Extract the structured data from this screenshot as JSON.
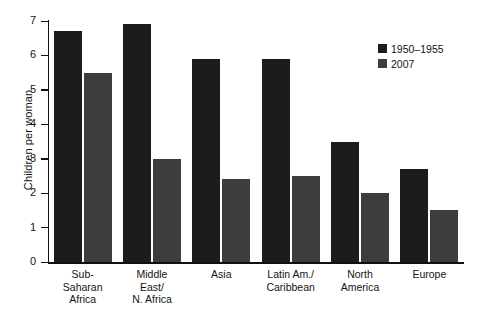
{
  "chart_data": {
    "type": "bar",
    "title": "",
    "subtitle": "",
    "xlabel": "",
    "ylabel": "Children per woman",
    "ylim": [
      0,
      7
    ],
    "ytick_labels": [
      "0",
      "1",
      "2",
      "3",
      "4",
      "5",
      "6",
      "7"
    ],
    "grid": false,
    "legend_position": "top-right",
    "categories": [
      "Sub-Saharan Africa",
      "Middle East/ N. Africa",
      "Asia",
      "Latin Am./ Caribbean",
      "North America",
      "Europe"
    ],
    "category_lines": [
      [
        "Sub-",
        "Saharan",
        "Africa"
      ],
      [
        "Middle",
        "East/",
        "N. Africa"
      ],
      [
        "Asia"
      ],
      [
        "Latin Am./",
        "Caribbean"
      ],
      [
        "North",
        "America"
      ],
      [
        "Europe"
      ]
    ],
    "series": [
      {
        "name": "1950–1955",
        "color": "#1c1c1c",
        "values": [
          6.7,
          6.9,
          5.9,
          5.9,
          3.5,
          2.7
        ],
        "value_labels": [
          "6.7",
          "6.9",
          "5.9",
          "5.9",
          "3.5",
          "2.7"
        ]
      },
      {
        "name": "2007",
        "color": "#3d3d3d",
        "values": [
          5.5,
          3.0,
          2.4,
          2.5,
          2.0,
          1.5
        ],
        "value_labels": [
          "5.5",
          "3.0",
          "2.4",
          "2.5",
          "2.0",
          "1.5"
        ]
      }
    ]
  },
  "legend": {
    "entries": [
      {
        "label": "1950–1955",
        "color": "#1c1c1c"
      },
      {
        "label": "2007",
        "color": "#3d3d3d"
      }
    ]
  },
  "axis": {
    "y_title": "Children per woman"
  }
}
